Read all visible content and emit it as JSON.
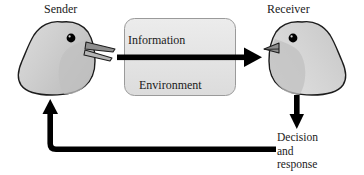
{
  "figure": {
    "width": 364,
    "height": 175,
    "background_color": "#ffffff"
  },
  "labels": {
    "sender": "Sender",
    "receiver": "Receiver",
    "information": "Information",
    "environment": "Environment",
    "decision_line1": "Decision",
    "decision_line2": "and",
    "decision_line3": "response"
  },
  "colors": {
    "text": "#1a1a1a",
    "arrow": "#000000",
    "bird_fill": "#c9c9c9",
    "bird_fill_light": "#d8d8d8",
    "bird_outline": "#1c1c1c",
    "bird_eye": "#000000",
    "beak_fill": "#8c8c8c",
    "box_fill": "#e3e3e3",
    "box_border": "#9a9a9a"
  },
  "shapes": {
    "environment_box": {
      "name": "environment-box",
      "x": 124,
      "y": 18,
      "width": 112,
      "height": 78,
      "corner_radius": 10
    },
    "information_arrow": {
      "name": "information-arrow",
      "direction": "right",
      "from_x": 117,
      "to_x": 262,
      "y": 57
    },
    "decision_arrow": {
      "name": "decision-arrow",
      "direction": "down",
      "x": 297,
      "from_y": 95,
      "to_y": 129
    },
    "feedback_arrow": {
      "name": "feedback-arrow",
      "direction": "up-left",
      "start_x": 276,
      "horizontal_y": 149,
      "corner_x": 50,
      "tip_y": 99
    },
    "sender_bird": {
      "name": "sender-bird",
      "facing": "right",
      "beak": "open"
    },
    "receiver_bird": {
      "name": "receiver-bird",
      "facing": "left",
      "beak": "closed"
    }
  },
  "icons": {
    "sender_bird_icon": "bird-head-singing-icon",
    "receiver_bird_icon": "bird-head-listening-icon",
    "right_arrow_icon": "arrow-right-icon",
    "down_arrow_icon": "arrow-down-icon",
    "feedback_arrow_icon": "arrow-feedback-loop-icon"
  }
}
